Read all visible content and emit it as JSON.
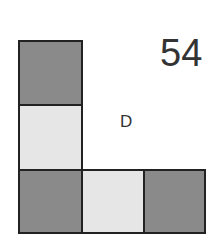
{
  "puzzle": {
    "number": "54",
    "option_letter": "D"
  },
  "colors": {
    "dark": "#8a8a8a",
    "light": "#e6e6e6",
    "border": "#222222"
  },
  "cells": [
    {
      "row": 0,
      "col": 0,
      "shade": "dark"
    },
    {
      "row": 1,
      "col": 0,
      "shade": "light"
    },
    {
      "row": 2,
      "col": 0,
      "shade": "dark"
    },
    {
      "row": 2,
      "col": 1,
      "shade": "light"
    },
    {
      "row": 2,
      "col": 2,
      "shade": "dark"
    }
  ]
}
